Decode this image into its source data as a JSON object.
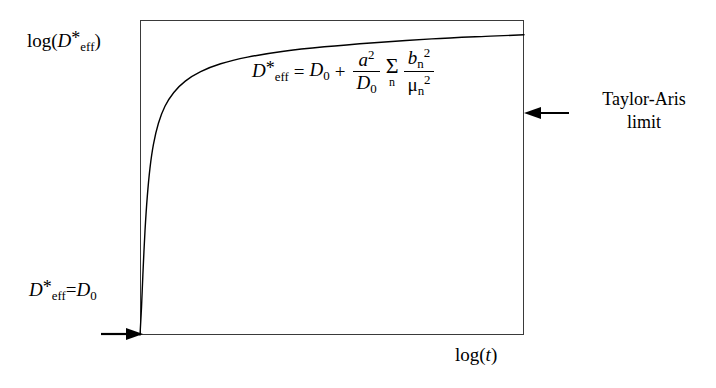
{
  "figure": {
    "background_color": "#ffffff",
    "line_color": "#000000",
    "frame_color": "#3a3a3a"
  },
  "chart_data": {
    "type": "line",
    "title": "",
    "xlabel": "log(t)",
    "ylabel": "log(D*eff)",
    "grid": false,
    "legend": "none",
    "axis_ticks": "none",
    "xlim": [
      0,
      1
    ],
    "ylim": [
      0,
      1
    ],
    "series": [
      {
        "name": "effective dispersion coefficient",
        "description": "Rises steeply from D*eff = D0 at short times and saturates at the Taylor-Aris limit plateau",
        "x": [
          0.0,
          0.004,
          0.008,
          0.013,
          0.019,
          0.026,
          0.035,
          0.048,
          0.065,
          0.088,
          0.118,
          0.158,
          0.21,
          0.28,
          0.37,
          0.48,
          0.61,
          0.76,
          0.9,
          1.0
        ],
        "y": [
          0.0,
          0.09,
          0.205,
          0.33,
          0.44,
          0.53,
          0.605,
          0.672,
          0.726,
          0.77,
          0.806,
          0.836,
          0.861,
          0.882,
          0.9,
          0.915,
          0.928,
          0.94,
          0.948,
          0.953
        ],
        "plateau_y": 0.953,
        "start_y": 0.0
      }
    ],
    "annotations": [
      {
        "name": "taylor-aris-limit",
        "text": "Taylor-Aris limit",
        "line1": "Taylor-Aris",
        "line2": "limit",
        "arrow": "left",
        "points_to": "plateau at right edge of plot"
      },
      {
        "name": "initial-value",
        "text": "D*eff = D0",
        "arrow": "right",
        "points_to": "origin at lower-left of plot"
      }
    ],
    "equation": {
      "full_text": "D*eff = D0 + (a^2/D0) * Sum_n (b_n^2 / mu_n^2)",
      "lhs_base": "D",
      "lhs_star": "*",
      "lhs_sub": "eff",
      "equals": "=",
      "term1_base": "D",
      "term1_sub": "0",
      "plus": "+",
      "frac1_num_base": "a",
      "frac1_num_sup": "2",
      "frac1_den_base": "D",
      "frac1_den_sub": "0",
      "sum_symbol": "Σ",
      "sum_index": "n",
      "frac2_num_base": "b",
      "frac2_num_sub": "n",
      "frac2_num_sup": "2",
      "frac2_den_base": "μ",
      "frac2_den_sub": "n",
      "frac2_den_sup": "2"
    }
  },
  "labels": {
    "ylabel_prefix": "log(",
    "ylabel_base": "D",
    "ylabel_star": "*",
    "ylabel_sub": "eff",
    "ylabel_suffix": ")",
    "xlabel_prefix": "log(",
    "xlabel_var": "t",
    "xlabel_suffix": ")",
    "d0_base": "D",
    "d0_star": "*",
    "d0_sub": "eff",
    "d0_equals": "=",
    "d0_term_base": "D",
    "d0_term_sub": "0",
    "taylor_line1": "Taylor-Aris",
    "taylor_line2": "limit"
  }
}
